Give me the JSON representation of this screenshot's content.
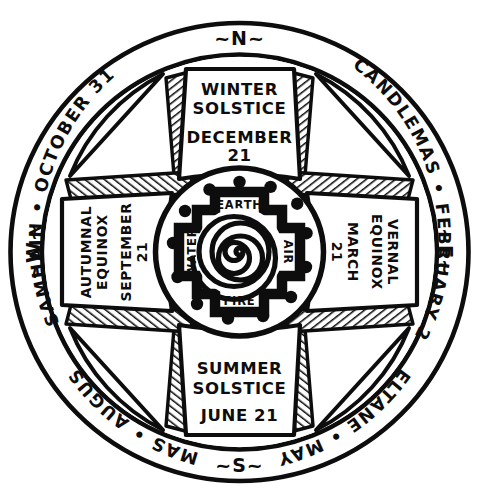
{
  "artwork": {
    "title": "Wheel of the Year",
    "medium": "ink-drawing",
    "background_color": "#ffffff",
    "ink_color": "#0d0d0d"
  },
  "outer_ring": {
    "festivals": [
      {
        "id": "samhain",
        "label": "SAMHAIN • OCTOBER 31",
        "position": "upper-left"
      },
      {
        "id": "candlemas",
        "label": "CANDLEMAS • FEBRUARY 2",
        "position": "upper-right"
      },
      {
        "id": "beltane",
        "label": "BELTANE • MAY 1",
        "position": "lower-right"
      },
      {
        "id": "lammas",
        "label": "LAMMAS • AUGUST 1",
        "position": "lower-left"
      }
    ],
    "compass_points": [
      {
        "id": "north",
        "label": "~N~",
        "position": "top"
      },
      {
        "id": "east",
        "label": "~E~",
        "position": "right"
      },
      {
        "id": "south",
        "label": "~S~",
        "position": "bottom"
      },
      {
        "id": "west",
        "label": "~W~",
        "position": "left"
      }
    ]
  },
  "quarter_panels": [
    {
      "id": "winter-solstice",
      "position": "top",
      "title_line1": "WINTER",
      "title_line2": "SOLSTICE",
      "date_line1": "DECEMBER",
      "date_line2": "21"
    },
    {
      "id": "vernal-equinox",
      "position": "right",
      "title_line1": "VERNAL",
      "title_line2": "EQUINOX",
      "date_line1": "MARCH",
      "date_line2": "21"
    },
    {
      "id": "summer-solstice",
      "position": "bottom",
      "title_line1": "SUMMER",
      "title_line2": "SOLSTICE",
      "date_line1": "JUNE 21",
      "date_line2": ""
    },
    {
      "id": "autumnal-equinox",
      "position": "left",
      "title_line1": "AUTUMNAL",
      "title_line2": "EQUINOX",
      "date_line1": "SEPTEMBER",
      "date_line2": "21"
    }
  ],
  "inner_hub": {
    "dot_count": 13,
    "elements": [
      {
        "id": "earth",
        "label": "EARTH",
        "position": "top"
      },
      {
        "id": "air",
        "label": "AIR",
        "position": "right"
      },
      {
        "id": "fire",
        "label": "FIRE",
        "position": "bottom"
      },
      {
        "id": "water",
        "label": "WATER",
        "position": "left"
      }
    ],
    "center_motif": "spiral",
    "spiral_turns": 5
  }
}
